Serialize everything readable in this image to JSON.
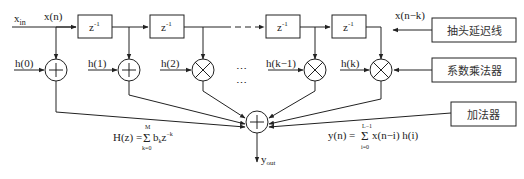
{
  "diagram": {
    "input_label": "x",
    "input_sub": "in",
    "xn_label": "x(n)",
    "xnk_label": "x(n−k)",
    "delay_label": "z",
    "delay_exp": "-1",
    "coefficients": [
      "h(0)",
      "h(1)",
      "h(2)",
      "h(k−1)",
      "h(k)"
    ],
    "ellipsis": "⋯",
    "output_label": "y",
    "output_sub": "out",
    "legend": {
      "tap_delay_line": "抽头延迟线",
      "coeff_multiplier": "系数乘法器",
      "adder": "加法器"
    },
    "formula_H": {
      "lhs": "H(z) =",
      "sum_top": "M",
      "sum_bottom": "k=0",
      "rhs": "b",
      "rhs_sub": "k",
      "rhs2": "z",
      "rhs2_exp": "−k"
    },
    "formula_y": {
      "lhs": "y(n) =",
      "sum_top": "L−1",
      "sum_bottom": "i=0",
      "rhs": "x(n−i) h(i)"
    }
  }
}
